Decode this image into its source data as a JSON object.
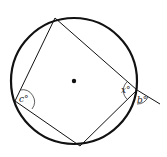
{
  "diagram": {
    "labels": {
      "c": "c°",
      "x": "x°",
      "b": "b°"
    },
    "circle": {
      "cx": 74,
      "cy": 81,
      "r": 63
    },
    "vertices": {
      "top": [
        55,
        18
      ],
      "left": [
        15,
        101
      ],
      "bottom": [
        80,
        146
      ],
      "right": [
        137,
        90
      ]
    },
    "extension_end": [
      160,
      104
    ]
  }
}
